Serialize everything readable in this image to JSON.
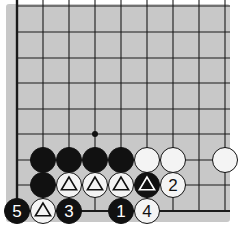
{
  "diagram": {
    "type": "go-board-fragment",
    "board_color": "#c8c8c8",
    "grid": {
      "columns": 9,
      "rows": 9,
      "x": [
        17,
        43,
        69,
        95,
        121,
        147,
        173,
        199,
        225
      ],
      "y": [
        6,
        32,
        58,
        83,
        109,
        134,
        160,
        185,
        211
      ],
      "left_edge": true,
      "bottom_edge": true
    },
    "star_points": [
      {
        "col": 3,
        "row": 5
      }
    ],
    "stones": [
      {
        "col": 1,
        "row": 6,
        "color": "black",
        "label": ""
      },
      {
        "col": 2,
        "row": 6,
        "color": "black",
        "label": ""
      },
      {
        "col": 3,
        "row": 6,
        "color": "black",
        "label": ""
      },
      {
        "col": 4,
        "row": 6,
        "color": "black",
        "label": ""
      },
      {
        "col": 5,
        "row": 6,
        "color": "white",
        "label": ""
      },
      {
        "col": 6,
        "row": 6,
        "color": "white",
        "label": ""
      },
      {
        "col": 8,
        "row": 6,
        "color": "white",
        "label": ""
      },
      {
        "col": 1,
        "row": 7,
        "color": "black",
        "label": ""
      },
      {
        "col": 2,
        "row": 7,
        "color": "white",
        "label": "",
        "mark": "triangle"
      },
      {
        "col": 3,
        "row": 7,
        "color": "white",
        "label": "",
        "mark": "triangle"
      },
      {
        "col": 4,
        "row": 7,
        "color": "white",
        "label": "",
        "mark": "triangle"
      },
      {
        "col": 5,
        "row": 7,
        "color": "black",
        "label": "",
        "mark": "triangle"
      },
      {
        "col": 6,
        "row": 7,
        "color": "white",
        "label": "2"
      },
      {
        "col": 0,
        "row": 8,
        "color": "black",
        "label": "5"
      },
      {
        "col": 1,
        "row": 8,
        "color": "white",
        "label": "",
        "mark": "triangle"
      },
      {
        "col": 2,
        "row": 8,
        "color": "black",
        "label": "3"
      },
      {
        "col": 4,
        "row": 8,
        "color": "black",
        "label": "1"
      },
      {
        "col": 5,
        "row": 8,
        "color": "white",
        "label": "4"
      }
    ]
  }
}
